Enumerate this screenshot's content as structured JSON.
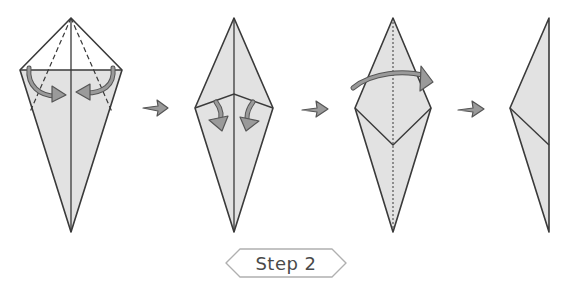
{
  "diagram": {
    "step_label": "Step 2",
    "colors": {
      "paper_fill": "#e2e2e2",
      "outline": "#3a3a3a",
      "arrow_fill": "#9a9a9a",
      "arrow_stroke": "#555555",
      "badge_stroke": "#b0b0b0",
      "background": "#ffffff"
    },
    "panels": [
      {
        "index": 1,
        "description": "Kite base with top triangle; fold both lower edges to center crease along dashed lines",
        "arrows": "two curved fold arrows pointing inward"
      },
      {
        "index": 2,
        "description": "Diamond with top flaps folded; fold flaps down",
        "arrows": "two curved arrows pointing downward"
      },
      {
        "index": 3,
        "description": "Diamond with V-fold; dotted center line; fold left half over to right",
        "arrows": "one curved arrow across top pointing right"
      },
      {
        "index": 4,
        "description": "Result: half-diamond shape folded in half",
        "arrows": "none"
      }
    ],
    "step_arrows": [
      "next-step-arrow",
      "next-step-arrow",
      "next-step-arrow"
    ]
  }
}
